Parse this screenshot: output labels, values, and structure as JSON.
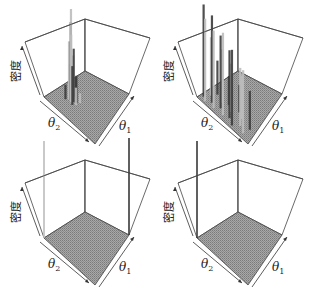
{
  "chart_data": [
    {
      "type": "surface3d-bars",
      "panel": "top-left",
      "zlabel": "密度",
      "xlabel": "θ2",
      "ylabel": "θ1",
      "description": "Single concentrated peak near the left/back region of the floor",
      "offset": [
        0,
        0
      ],
      "bars": [
        {
          "u": 0.3,
          "v": 0.3,
          "h": 0.95
        },
        {
          "u": 0.28,
          "v": 0.32,
          "h": 0.8
        },
        {
          "u": 0.32,
          "v": 0.28,
          "h": 0.7
        },
        {
          "u": 0.26,
          "v": 0.3,
          "h": 0.6
        },
        {
          "u": 0.34,
          "v": 0.32,
          "h": 0.55
        },
        {
          "u": 0.3,
          "v": 0.36,
          "h": 0.45
        },
        {
          "u": 0.36,
          "v": 0.26,
          "h": 0.4
        },
        {
          "u": 0.24,
          "v": 0.34,
          "h": 0.35
        },
        {
          "u": 0.38,
          "v": 0.34,
          "h": 0.28
        },
        {
          "u": 0.32,
          "v": 0.4,
          "h": 0.22
        },
        {
          "u": 0.4,
          "v": 0.3,
          "h": 0.18
        },
        {
          "u": 0.22,
          "v": 0.26,
          "h": 0.15
        },
        {
          "u": 0.42,
          "v": 0.38,
          "h": 0.1
        },
        {
          "u": 0.28,
          "v": 0.42,
          "h": 0.08
        }
      ]
    },
    {
      "type": "surface3d-bars",
      "panel": "top-right",
      "zlabel": "密度",
      "xlabel": "θ2",
      "ylabel": "θ1",
      "description": "Many tall scattered spikes along the θ2 edge",
      "offset": [
        153,
        0
      ],
      "bars": [
        {
          "u": 0.05,
          "v": 0.1,
          "h": 0.95
        },
        {
          "u": 0.12,
          "v": 0.05,
          "h": 0.85
        },
        {
          "u": 0.2,
          "v": 0.12,
          "h": 0.9
        },
        {
          "u": 0.28,
          "v": 0.06,
          "h": 0.8
        },
        {
          "u": 0.35,
          "v": 0.15,
          "h": 0.75
        },
        {
          "u": 0.45,
          "v": 0.08,
          "h": 0.85
        },
        {
          "u": 0.55,
          "v": 0.12,
          "h": 0.7
        },
        {
          "u": 0.65,
          "v": 0.05,
          "h": 0.78
        },
        {
          "u": 0.75,
          "v": 0.14,
          "h": 0.6
        },
        {
          "u": 0.85,
          "v": 0.08,
          "h": 0.65
        },
        {
          "u": 0.1,
          "v": 0.22,
          "h": 0.6
        },
        {
          "u": 0.3,
          "v": 0.25,
          "h": 0.55
        },
        {
          "u": 0.5,
          "v": 0.22,
          "h": 0.5
        },
        {
          "u": 0.7,
          "v": 0.25,
          "h": 0.45
        },
        {
          "u": 0.9,
          "v": 0.2,
          "h": 0.4
        },
        {
          "u": 0.15,
          "v": 0.32,
          "h": 0.35
        },
        {
          "u": 0.4,
          "v": 0.3,
          "h": 0.3
        },
        {
          "u": 0.6,
          "v": 0.32,
          "h": 0.28
        }
      ]
    },
    {
      "type": "surface3d-bars",
      "panel": "bottom-left",
      "zlabel": "密度",
      "xlabel": "θ2",
      "ylabel": "θ1",
      "description": "Mass concentrated on two edges: a tall spike at the left corner and a spike at the front corner",
      "offset": [
        0,
        141
      ],
      "bars": [
        {
          "u": 0.0,
          "v": 0.0,
          "h": 1.0
        },
        {
          "u": 1.0,
          "v": 1.0,
          "h": 1.0
        }
      ]
    },
    {
      "type": "surface3d-bars",
      "panel": "bottom-right",
      "zlabel": "密度",
      "xlabel": "θ2",
      "ylabel": "θ1",
      "description": "Mass concentrated at the left corner only",
      "offset": [
        153,
        141
      ],
      "bars": [
        {
          "u": 0.0,
          "v": 0.0,
          "h": 1.0
        }
      ]
    }
  ],
  "labels": {
    "density": "密度",
    "theta": "θ",
    "sub1": "1",
    "sub2": "2"
  },
  "colors": {
    "floor": "#9a9a9a",
    "floor_dark": "#6e6e6e",
    "edge": "#444444",
    "bar_light": "#bdbdbd",
    "bar_dark": "#3c3c3c"
  }
}
